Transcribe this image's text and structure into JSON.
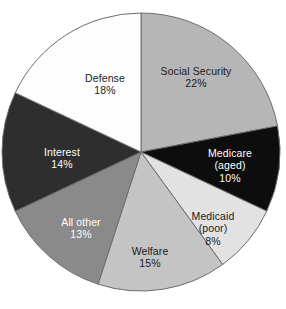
{
  "figure": {
    "background_color": "#ffffff",
    "width": 286,
    "height": 309,
    "slice_border_color": "#6e6e6e"
  },
  "chart_data": {
    "type": "pie",
    "title": "",
    "subtitle": "",
    "xlabel": "",
    "ylabel": "",
    "legend_position": "none",
    "grid": false,
    "labels_inside_slices": true,
    "start_angle_deg": 0,
    "direction": "clockwise",
    "value_unit": "%",
    "total": 100,
    "categories": [
      "Social Security",
      "Medicare (aged)",
      "Medicaid (poor)",
      "Welfare",
      "All other",
      "Interest",
      "Defense"
    ],
    "values": [
      22,
      10,
      8,
      15,
      13,
      14,
      18
    ],
    "slices": [
      {
        "name": "Social Security",
        "label_line1": "Social Security",
        "label_line2": "",
        "value": 22,
        "value_label": "22%",
        "color": "#b6b6b6",
        "text_color": "#1b1b1b",
        "text_style": "lbl-dark",
        "label_x": 196,
        "label_y": 77
      },
      {
        "name": "Medicare (aged)",
        "label_line1": "Medicare",
        "label_line2": "(aged)",
        "value": 10,
        "value_label": "10%",
        "color": "#0d0d0d",
        "text_color": "#ffffff",
        "text_style": "lbl-light",
        "label_x": 230,
        "label_y": 166
      },
      {
        "name": "Medicaid (poor)",
        "label_line1": "Medicaid",
        "label_line2": "(poor)",
        "value": 8,
        "value_label": "8%",
        "color": "#e2e2e2",
        "text_color": "#1b1b1b",
        "text_style": "lbl-dark",
        "label_x": 213,
        "label_y": 229
      },
      {
        "name": "Welfare",
        "label_line1": "Welfare",
        "label_line2": "",
        "value": 15,
        "value_label": "15%",
        "color": "#c4c4c4",
        "text_color": "#1b1b1b",
        "text_style": "lbl-dark",
        "label_x": 150,
        "label_y": 257
      },
      {
        "name": "All other",
        "label_line1": "All other",
        "label_line2": "",
        "value": 13,
        "value_label": "13%",
        "color": "#8a8a8a",
        "text_color": "#ffffff",
        "text_style": "lbl-light",
        "label_x": 81,
        "label_y": 228
      },
      {
        "name": "Interest",
        "label_line1": "Interest",
        "label_line2": "",
        "value": 14,
        "value_label": "14%",
        "color": "#2e2e2e",
        "text_color": "#ffffff",
        "text_style": "lbl-light",
        "label_x": 62,
        "label_y": 158
      },
      {
        "name": "Defense",
        "label_line1": "Defense",
        "label_line2": "",
        "value": 18,
        "value_label": "18%",
        "color": "#fdfdfd",
        "text_color": "#1b1b1b",
        "text_style": "lbl-dark",
        "label_x": 105,
        "label_y": 84
      }
    ],
    "geometry": {
      "center_x": 141,
      "center_y": 152,
      "radius": 139
    }
  }
}
